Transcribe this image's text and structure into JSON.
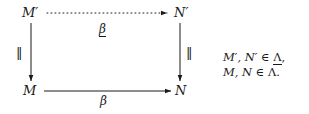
{
  "figure": {
    "type": "commutative-diagram",
    "background_color": "#ffffff",
    "ink_color": "#1a1a1a"
  },
  "nodes": {
    "top_left": "M′",
    "top_right": "N′",
    "bottom_left": "M",
    "bottom_right": "N"
  },
  "edges": {
    "top": {
      "label": "β",
      "label_underlined": true,
      "style": "dotted",
      "direction": "left-to-right",
      "arrowhead": "solid-triangle"
    },
    "bottom": {
      "label": "β",
      "label_underlined": false,
      "style": "solid",
      "direction": "left-to-right",
      "arrowhead": "solid-triangle"
    },
    "left_vertical": {
      "label": "‖",
      "style": "solid",
      "direction": "top-to-bottom",
      "arrowhead": "solid-triangle"
    },
    "right_vertical": {
      "label": "‖",
      "style": "solid",
      "direction": "top-to-bottom",
      "arrowhead": "solid-triangle"
    }
  },
  "side_note": {
    "line1_prefix": "M′, N′ ∈ ",
    "line1_symbol": "Λ",
    "line1_suffix": ",",
    "line2_prefix": "M, N ∈ ",
    "line2_symbol": "Λ",
    "line2_suffix": "."
  }
}
